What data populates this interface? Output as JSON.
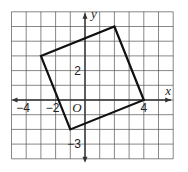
{
  "grid": {
    "x_min": -5,
    "x_max": 6,
    "y_min": -4,
    "y_max": 6,
    "origin_px": [
      85,
      100
    ],
    "cell_px": 14.7,
    "grid_color": "#555555",
    "axis_color": "#333333"
  },
  "axes": {
    "x_label": "x",
    "y_label": "y",
    "origin_label": "O"
  },
  "tick_labels": [
    {
      "axis": "x",
      "value": -4,
      "text": "−4"
    },
    {
      "axis": "x",
      "value": -2,
      "text": "−2"
    },
    {
      "axis": "x",
      "value": 4,
      "text": "4"
    },
    {
      "axis": "y",
      "value": 2,
      "text": "2"
    },
    {
      "axis": "y",
      "value": -3,
      "text": "−3"
    }
  ],
  "polygon": {
    "name": "square",
    "stroke": "#111111",
    "vertices": [
      [
        -3,
        3
      ],
      [
        2,
        5
      ],
      [
        4,
        0
      ],
      [
        -1,
        -2
      ]
    ]
  }
}
